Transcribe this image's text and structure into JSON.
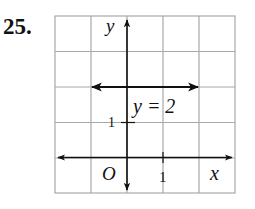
{
  "problem": {
    "number": "25."
  },
  "graph": {
    "axis_labels": {
      "x": "x",
      "y": "y",
      "origin": "O"
    },
    "tick_labels": {
      "x": "1",
      "y": "1"
    },
    "line_label": "y = 2",
    "grid": {
      "columns": 5,
      "rows": 5,
      "x_range": [
        -2,
        3
      ],
      "y_range": [
        -1,
        4
      ]
    },
    "colors": {
      "grid": "#a8a8a8",
      "axes": "#111111",
      "line": "#111111"
    }
  }
}
